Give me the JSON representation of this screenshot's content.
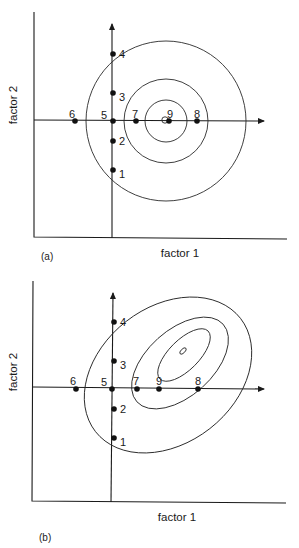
{
  "panels": [
    {
      "tag": "(a)",
      "x_label": "factor 1",
      "y_label": "factor 2",
      "contour_shape": "concentric circles",
      "points": [
        {
          "label": "1",
          "x": 113,
          "y": 170
        },
        {
          "label": "2",
          "x": 113,
          "y": 141
        },
        {
          "label": "3",
          "x": 113,
          "y": 93
        },
        {
          "label": "4",
          "x": 113,
          "y": 54
        },
        {
          "label": "5",
          "x": 113,
          "y": 121
        },
        {
          "label": "6",
          "x": 75,
          "y": 121
        },
        {
          "label": "7",
          "x": 136,
          "y": 121
        },
        {
          "label": "8",
          "x": 197,
          "y": 121
        },
        {
          "label": "9",
          "x": 169,
          "y": 121
        }
      ]
    },
    {
      "tag": "(b)",
      "x_label": "factor 1",
      "y_label": "factor 2",
      "contour_shape": "tilted ellipses",
      "points": [
        {
          "label": "1",
          "x": 114,
          "y": 438
        },
        {
          "label": "2",
          "x": 114,
          "y": 409
        },
        {
          "label": "3",
          "x": 114,
          "y": 361
        },
        {
          "label": "4",
          "x": 114,
          "y": 322
        },
        {
          "label": "5",
          "x": 112,
          "y": 389
        },
        {
          "label": "6",
          "x": 76,
          "y": 389
        },
        {
          "label": "7",
          "x": 137,
          "y": 389
        },
        {
          "label": "8",
          "x": 198,
          "y": 389
        },
        {
          "label": "9",
          "x": 159,
          "y": 389
        }
      ]
    }
  ],
  "colors": {
    "ink": "#1a1a1a",
    "background": "#ffffff"
  }
}
